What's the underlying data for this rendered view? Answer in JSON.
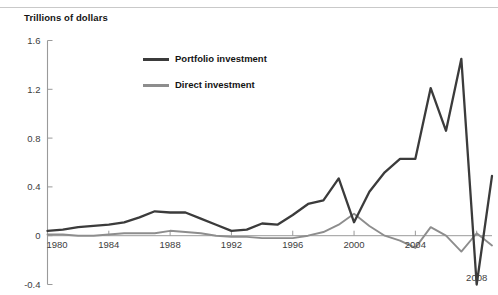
{
  "chart_data": {
    "type": "line",
    "title": "",
    "subtitle": "",
    "ylabel": "Trillions of dollars",
    "xlabel": "",
    "ylim": [
      -0.4,
      1.6
    ],
    "xlim": [
      1980,
      2009
    ],
    "grid": false,
    "legend_position": "upper-center",
    "y_ticks": [
      "1.6",
      "1.2",
      "0.8",
      "0.4",
      "0",
      "-0.4"
    ],
    "y_tick_values": [
      1.6,
      1.2,
      0.8,
      0.4,
      0,
      -0.4
    ],
    "x_ticks": [
      "1980",
      "1984",
      "1988",
      "1992",
      "1996",
      "2000",
      "2004",
      "2008"
    ],
    "x_tick_values": [
      1980,
      1984,
      1988,
      1992,
      1996,
      2000,
      2004,
      2008
    ],
    "x": [
      1980,
      1981,
      1982,
      1983,
      1984,
      1985,
      1986,
      1987,
      1988,
      1989,
      1990,
      1991,
      1992,
      1993,
      1994,
      1995,
      1996,
      1997,
      1998,
      1999,
      2000,
      2001,
      2002,
      2003,
      2004,
      2005,
      2006,
      2007,
      2008,
      2009
    ],
    "series": [
      {
        "name": "Portfolio investment",
        "color": "#3b3b3b",
        "values": [
          0.04,
          0.05,
          0.07,
          0.08,
          0.09,
          0.11,
          0.15,
          0.2,
          0.19,
          0.19,
          0.14,
          0.09,
          0.04,
          0.05,
          0.1,
          0.09,
          0.17,
          0.26,
          0.29,
          0.47,
          0.11,
          0.36,
          0.52,
          0.63,
          0.63,
          1.21,
          0.86,
          1.45,
          -0.4,
          0.49
        ]
      },
      {
        "name": "Direct investment",
        "color": "#8d8d8d",
        "values": [
          0.01,
          0.01,
          0.0,
          0.0,
          0.01,
          0.02,
          0.02,
          0.02,
          0.04,
          0.03,
          0.02,
          0.0,
          -0.01,
          -0.01,
          -0.02,
          -0.02,
          -0.02,
          0.0,
          0.03,
          0.09,
          0.18,
          0.08,
          0.0,
          -0.04,
          -0.1,
          0.07,
          0.0,
          -0.13,
          0.02,
          -0.08
        ]
      }
    ]
  },
  "legend": {
    "items": [
      {
        "label": "Portfolio investment",
        "color": "#3b3b3b"
      },
      {
        "label": "Direct investment",
        "color": "#8d8d8d"
      }
    ]
  },
  "axis": {
    "y_title": "Trillions of dollars"
  }
}
